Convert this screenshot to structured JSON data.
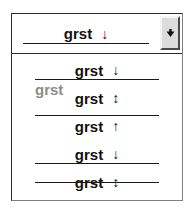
{
  "widget": {
    "type": "combobox",
    "name": "text-decoration-picker",
    "expanded": true,
    "colors": {
      "text": "#111111",
      "rule": "#1a1a1a",
      "ghost_text": "#8d8d8d",
      "frame": "#2b2b2b",
      "button_face": "#dcdcdc",
      "background": "#ffffff"
    }
  },
  "field": {
    "selected_label": "grst",
    "selected_arrow": "↓",
    "selected_decoration": "underline",
    "button_icon": "chevron-down-icon"
  },
  "list": {
    "items": [
      {
        "label": "grst",
        "arrow": "↓",
        "decoration": "underline",
        "doubled": false
      },
      {
        "label": "grst",
        "arrow": "↕",
        "decoration": "none",
        "doubled": true
      },
      {
        "label": "grst",
        "arrow": "↑",
        "decoration": "overline",
        "doubled": false
      },
      {
        "label": "grst",
        "arrow": "↓",
        "decoration": "underline",
        "doubled": false
      },
      {
        "label": "grst",
        "arrow": "↕",
        "decoration": "line-through",
        "doubled": false
      }
    ]
  }
}
